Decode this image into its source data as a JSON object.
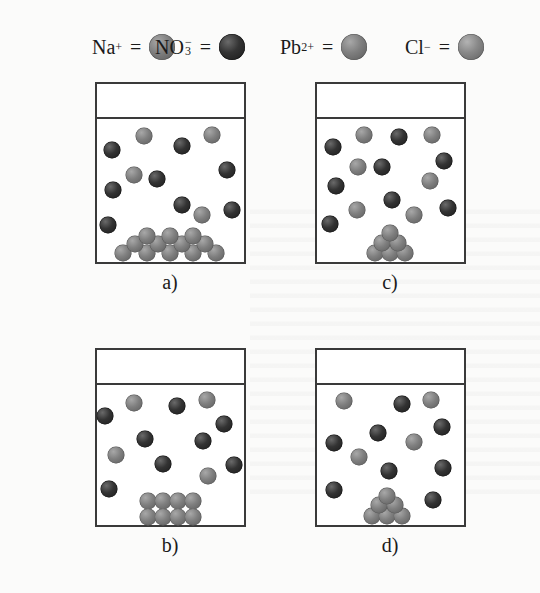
{
  "legend": [
    {
      "symbol": "Na",
      "charge": "+",
      "equals": "=",
      "color_role": "gray",
      "x": 92
    },
    {
      "symbol": "NO",
      "subscript": "3",
      "charge": "−",
      "equals": "=",
      "color_role": "dark",
      "x": 155
    },
    {
      "symbol": "Pb",
      "charge": "2+",
      "equals": "=",
      "color_role": "gray",
      "x": 280
    },
    {
      "symbol": "Cl",
      "charge": "−",
      "equals": "=",
      "color_role": "cl",
      "x": 405
    }
  ],
  "colors": {
    "gray": "#7f7f7f",
    "dark": "#2a2a2a",
    "cl": "#888888",
    "border": "#3a3a3a"
  },
  "beakers": [
    {
      "id": "a",
      "label": "a)",
      "box": {
        "x": 95,
        "y": 82,
        "w": 151,
        "h": 182,
        "line_y": 117
      },
      "label_pos": {
        "x": 170,
        "y": 283
      },
      "ions": [
        {
          "x": 144,
          "y": 136,
          "c": "gray"
        },
        {
          "x": 112,
          "y": 150,
          "c": "dark"
        },
        {
          "x": 212,
          "y": 135,
          "c": "gray"
        },
        {
          "x": 182,
          "y": 146,
          "c": "dark"
        },
        {
          "x": 227,
          "y": 170,
          "c": "dark"
        },
        {
          "x": 134,
          "y": 175,
          "c": "gray"
        },
        {
          "x": 157,
          "y": 179,
          "c": "dark"
        },
        {
          "x": 113,
          "y": 190,
          "c": "dark"
        },
        {
          "x": 182,
          "y": 205,
          "c": "dark"
        },
        {
          "x": 202,
          "y": 215,
          "c": "gray"
        },
        {
          "x": 232,
          "y": 210,
          "c": "dark"
        },
        {
          "x": 108,
          "y": 225,
          "c": "dark"
        }
      ],
      "precipitate": [
        {
          "x": 123,
          "y": 253
        },
        {
          "x": 147,
          "y": 253
        },
        {
          "x": 170,
          "y": 253
        },
        {
          "x": 193,
          "y": 253
        },
        {
          "x": 216,
          "y": 253
        },
        {
          "x": 135,
          "y": 244
        },
        {
          "x": 158,
          "y": 244
        },
        {
          "x": 182,
          "y": 244
        },
        {
          "x": 205,
          "y": 244
        },
        {
          "x": 147,
          "y": 236
        },
        {
          "x": 170,
          "y": 236
        },
        {
          "x": 193,
          "y": 236
        }
      ]
    },
    {
      "id": "c",
      "label": "c)",
      "box": {
        "x": 315,
        "y": 82,
        "w": 151,
        "h": 182,
        "line_y": 117
      },
      "label_pos": {
        "x": 390,
        "y": 283
      },
      "ions": [
        {
          "x": 364,
          "y": 135,
          "c": "gray"
        },
        {
          "x": 399,
          "y": 137,
          "c": "dark"
        },
        {
          "x": 432,
          "y": 135,
          "c": "gray"
        },
        {
          "x": 333,
          "y": 147,
          "c": "dark"
        },
        {
          "x": 358,
          "y": 167,
          "c": "gray"
        },
        {
          "x": 382,
          "y": 167,
          "c": "dark"
        },
        {
          "x": 444,
          "y": 161,
          "c": "dark"
        },
        {
          "x": 430,
          "y": 181,
          "c": "gray"
        },
        {
          "x": 336,
          "y": 186,
          "c": "dark"
        },
        {
          "x": 392,
          "y": 200,
          "c": "dark"
        },
        {
          "x": 357,
          "y": 210,
          "c": "gray"
        },
        {
          "x": 414,
          "y": 215,
          "c": "gray"
        },
        {
          "x": 448,
          "y": 208,
          "c": "dark"
        },
        {
          "x": 330,
          "y": 224,
          "c": "dark"
        }
      ],
      "precipitate": [
        {
          "x": 375,
          "y": 253
        },
        {
          "x": 390,
          "y": 253
        },
        {
          "x": 405,
          "y": 253
        },
        {
          "x": 382,
          "y": 243
        },
        {
          "x": 398,
          "y": 243
        },
        {
          "x": 390,
          "y": 233
        }
      ]
    },
    {
      "id": "b",
      "label": "b)",
      "box": {
        "x": 95,
        "y": 348,
        "w": 151,
        "h": 179,
        "line_y": 383
      },
      "label_pos": {
        "x": 170,
        "y": 546
      },
      "ions": [
        {
          "x": 134,
          "y": 403,
          "c": "gray"
        },
        {
          "x": 105,
          "y": 416,
          "c": "dark"
        },
        {
          "x": 177,
          "y": 406,
          "c": "dark"
        },
        {
          "x": 207,
          "y": 400,
          "c": "gray"
        },
        {
          "x": 224,
          "y": 424,
          "c": "dark"
        },
        {
          "x": 145,
          "y": 439,
          "c": "dark"
        },
        {
          "x": 203,
          "y": 441,
          "c": "dark"
        },
        {
          "x": 116,
          "y": 455,
          "c": "gray"
        },
        {
          "x": 163,
          "y": 464,
          "c": "dark"
        },
        {
          "x": 234,
          "y": 465,
          "c": "dark"
        },
        {
          "x": 208,
          "y": 476,
          "c": "gray"
        },
        {
          "x": 109,
          "y": 489,
          "c": "dark"
        }
      ],
      "precipitate": [
        {
          "x": 148,
          "y": 501
        },
        {
          "x": 163,
          "y": 501
        },
        {
          "x": 178,
          "y": 501
        },
        {
          "x": 193,
          "y": 501
        },
        {
          "x": 148,
          "y": 517
        },
        {
          "x": 163,
          "y": 517
        },
        {
          "x": 178,
          "y": 517
        },
        {
          "x": 193,
          "y": 517
        }
      ]
    },
    {
      "id": "d",
      "label": "d)",
      "box": {
        "x": 315,
        "y": 348,
        "w": 151,
        "h": 179,
        "line_y": 383
      },
      "label_pos": {
        "x": 390,
        "y": 546
      },
      "ions": [
        {
          "x": 344,
          "y": 401,
          "c": "gray"
        },
        {
          "x": 402,
          "y": 404,
          "c": "dark"
        },
        {
          "x": 431,
          "y": 400,
          "c": "gray"
        },
        {
          "x": 442,
          "y": 427,
          "c": "dark"
        },
        {
          "x": 378,
          "y": 433,
          "c": "dark"
        },
        {
          "x": 414,
          "y": 442,
          "c": "gray"
        },
        {
          "x": 334,
          "y": 443,
          "c": "dark"
        },
        {
          "x": 359,
          "y": 457,
          "c": "gray"
        },
        {
          "x": 389,
          "y": 471,
          "c": "dark"
        },
        {
          "x": 443,
          "y": 468,
          "c": "dark"
        },
        {
          "x": 334,
          "y": 490,
          "c": "dark"
        },
        {
          "x": 433,
          "y": 500,
          "c": "dark"
        }
      ],
      "precipitate": [
        {
          "x": 372,
          "y": 516
        },
        {
          "x": 387,
          "y": 516
        },
        {
          "x": 402,
          "y": 516
        },
        {
          "x": 379,
          "y": 505
        },
        {
          "x": 395,
          "y": 505
        },
        {
          "x": 387,
          "y": 496
        }
      ]
    }
  ]
}
